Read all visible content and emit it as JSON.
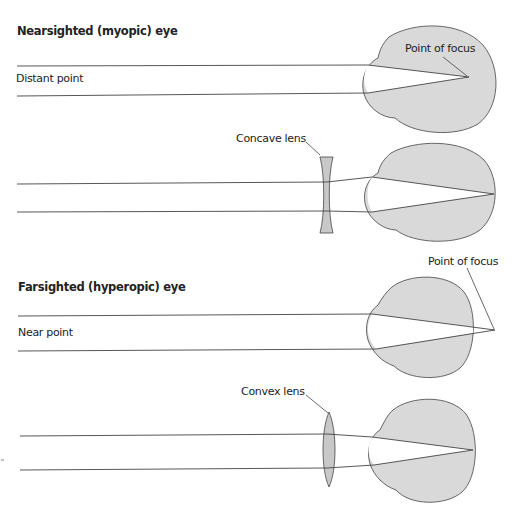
{
  "colors": {
    "eye_fill": "#d9d9d9",
    "lens_fill": "#c8c8c8",
    "stroke": "#444444",
    "background": "#ffffff"
  },
  "panels": [
    {
      "title": "Nearsighted (myopic) eye",
      "ray_label": "Distant point",
      "focus_label": "Point of focus",
      "lens": "none"
    },
    {
      "lens_label": "Concave lens",
      "lens": "concave"
    },
    {
      "title": "Farsighted (hyperopic) eye",
      "ray_label": "Near point",
      "focus_label": "Point of focus",
      "lens": "none"
    },
    {
      "lens_label": "Convex lens",
      "lens": "convex"
    }
  ]
}
